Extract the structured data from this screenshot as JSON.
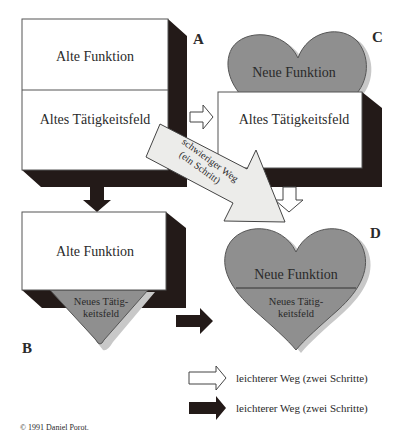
{
  "diagram": {
    "quadrant_labels": {
      "a": "A",
      "b": "B",
      "c": "C",
      "d": "D"
    },
    "box_a": {
      "top": "Alte Funktion",
      "bottom": "Altes Tätigkeitsfeld"
    },
    "box_b": {
      "top": "Alte Funktion",
      "bottom_line1": "Neues Tätig-",
      "bottom_line2": "keitsfeld"
    },
    "box_c": {
      "top": "Neue Funktion",
      "bottom": "Altes Tätigkeitsfeld"
    },
    "box_d": {
      "top": "Neue Funktion",
      "bottom_line1": "Neues Tätig-",
      "bottom_line2": "keitsfeld"
    },
    "diagonal_arrow": {
      "line1": "schwieriger Weg",
      "line2": "(ein Schritt)"
    },
    "colors": {
      "shadow": "#231a18",
      "gray": "#8f8f8f",
      "light_gray": "#c8c8c8",
      "arrow_fill": "#ececea"
    }
  },
  "legend": {
    "items": [
      {
        "icon": "white-arrow",
        "label": "leichterer Weg (zwei Schritte)"
      },
      {
        "icon": "black-arrow",
        "label": "leichterer Weg (zwei Schritte)"
      }
    ]
  },
  "copyright": "© 1991 Daniel Porot."
}
